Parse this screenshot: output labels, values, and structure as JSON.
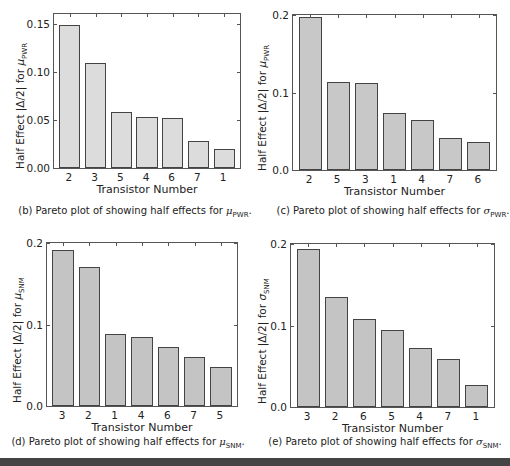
{
  "chart_data": [
    {
      "id": "b",
      "type": "bar",
      "title": "",
      "caption": "(b) Pareto plot of showing half effects for μPWR.",
      "caption_prefix": "(b) Pareto plot of showing half effects for ",
      "caption_symbol": "μ",
      "caption_sub": "PWR",
      "xlabel": "Transistor Number",
      "ylabel": "Half Effect |Δ/2| for μPWR",
      "ylabel_prefix": "Half Effect |Δ/2| for ",
      "ylabel_symbol": "μ",
      "ylabel_sub": "PWR",
      "categories": [
        "2",
        "3",
        "5",
        "4",
        "6",
        "7",
        "1"
      ],
      "values": [
        0.149,
        0.109,
        0.058,
        0.053,
        0.052,
        0.028,
        0.02
      ],
      "ylim": [
        0,
        0.16
      ],
      "yticks": [
        "0.00",
        "0.05",
        "0.10",
        "0.15"
      ],
      "ytick_values": [
        0,
        0.05,
        0.1,
        0.15
      ],
      "bar_color": "#dcdcdc",
      "grid": false,
      "legend": null
    },
    {
      "id": "c",
      "type": "bar",
      "title": "",
      "caption": "(c) Pareto plot of showing half effects for σPWR.",
      "caption_prefix": "(c) Pareto plot of showing half effects for ",
      "caption_symbol": "σ",
      "caption_sub": "PWR",
      "xlabel": "Transistor Number",
      "ylabel": "Half Effect |Δ/2| for μPWR",
      "ylabel_prefix": "Half Effect |Δ/2| for ",
      "ylabel_symbol": "μ",
      "ylabel_sub": "PWR",
      "categories": [
        "2",
        "5",
        "3",
        "1",
        "4",
        "7",
        "6"
      ],
      "values": [
        0.197,
        0.114,
        0.112,
        0.074,
        0.064,
        0.041,
        0.036
      ],
      "ylim": [
        0,
        0.2
      ],
      "yticks": [
        "0.0",
        "0.1",
        "0.2"
      ],
      "ytick_values": [
        0,
        0.1,
        0.2
      ],
      "bar_color": "#c8c8c8",
      "grid": false,
      "legend": null
    },
    {
      "id": "d",
      "type": "bar",
      "title": "",
      "caption": "(d) Pareto plot of showing half effects for μSNM.",
      "caption_prefix": "(d) Pareto plot of showing half effects for ",
      "caption_symbol": "μ",
      "caption_sub": "SNM",
      "xlabel": "Transistor Number",
      "ylabel": "Half Effect |Δ/2| for μSNM",
      "ylabel_prefix": "Half Effect |Δ/2| for ",
      "ylabel_symbol": "μ",
      "ylabel_sub": "SNM",
      "categories": [
        "3",
        "2",
        "1",
        "4",
        "6",
        "7",
        "5"
      ],
      "values": [
        0.191,
        0.17,
        0.088,
        0.085,
        0.073,
        0.06,
        0.048
      ],
      "ylim": [
        0,
        0.2
      ],
      "yticks": [
        "0.0",
        "0.1",
        "0.2"
      ],
      "ytick_values": [
        0,
        0.1,
        0.2
      ],
      "bar_color": "#c4c4c4",
      "grid": false,
      "legend": null
    },
    {
      "id": "e",
      "type": "bar",
      "title": "",
      "caption": "(e) Pareto plot of showing half effects for σSNM.",
      "caption_prefix": "(e) Pareto plot of showing half effects for ",
      "caption_symbol": "σ",
      "caption_sub": "SNM",
      "xlabel": "Transistor Number",
      "ylabel": "Half Effect |Δ/2| for σSNM",
      "ylabel_prefix": "Half Effect |Δ/2| for ",
      "ylabel_symbol": "σ",
      "ylabel_sub": "SNM",
      "categories": [
        "3",
        "2",
        "6",
        "5",
        "4",
        "7",
        "1"
      ],
      "values": [
        0.194,
        0.135,
        0.108,
        0.094,
        0.072,
        0.059,
        0.027
      ],
      "ylim": [
        0,
        0.2
      ],
      "yticks": [
        "0.0",
        "0.1",
        "0.2"
      ],
      "ytick_values": [
        0,
        0.1,
        0.2
      ],
      "bar_color": "#c4c4c4",
      "grid": false,
      "legend": null
    }
  ]
}
